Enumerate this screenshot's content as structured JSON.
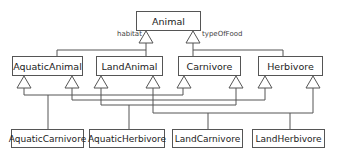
{
  "diagram": {
    "type": "UML class diagram (inheritance)",
    "root": {
      "name": "Animal"
    },
    "discriminators": [
      {
        "label": "habitat",
        "parent": "Animal",
        "children": [
          "AquaticAnimal",
          "LandAnimal"
        ]
      },
      {
        "label": "typeOfFood",
        "parent": "Animal",
        "children": [
          "Carnivore",
          "Herbivore"
        ]
      }
    ],
    "level2": [
      {
        "name": "AquaticAnimal"
      },
      {
        "name": "LandAnimal"
      },
      {
        "name": "Carnivore"
      },
      {
        "name": "Herbivore"
      }
    ],
    "level3": [
      {
        "name": "AquaticCarnivore",
        "parents": [
          "AquaticAnimal",
          "Carnivore"
        ]
      },
      {
        "name": "AquaticHerbivore",
        "parents": [
          "AquaticAnimal",
          "Herbivore"
        ]
      },
      {
        "name": "LandCarnivore",
        "parents": [
          "LandAnimal",
          "Carnivore"
        ]
      },
      {
        "name": "LandHerbivore",
        "parents": [
          "LandAnimal",
          "Herbivore"
        ]
      }
    ],
    "colors": {
      "line": "#555555",
      "text": "#222222",
      "background": "#ffffff"
    }
  }
}
